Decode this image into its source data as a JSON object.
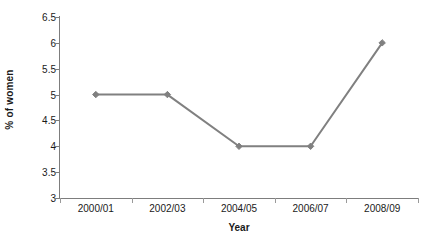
{
  "chart_data": {
    "type": "line",
    "title": "",
    "xlabel": "Year",
    "ylabel": "% of women",
    "categories": [
      "2000/01",
      "2002/03",
      "2004/05",
      "2006/07",
      "2008/09"
    ],
    "values": [
      5,
      5,
      4,
      4,
      6
    ],
    "series": [
      {
        "name": "% of women",
        "values": [
          5,
          5,
          4,
          4,
          6
        ]
      }
    ],
    "ylim": [
      3,
      6.5
    ],
    "yticks": [
      "3",
      "3.5",
      "4",
      "4.5",
      "5",
      "5.5",
      "6",
      "6.5"
    ],
    "ytick_values": [
      3,
      3.5,
      4,
      4.5,
      5,
      5.5,
      6,
      6.5
    ],
    "grid": false,
    "legend": false,
    "legend_position": "none",
    "marker": "diamond",
    "colors": {
      "line": "#808080",
      "marker": "#808080",
      "axis": "#7d7d7d",
      "text": "#1a1a1a",
      "background": "#ffffff"
    }
  }
}
